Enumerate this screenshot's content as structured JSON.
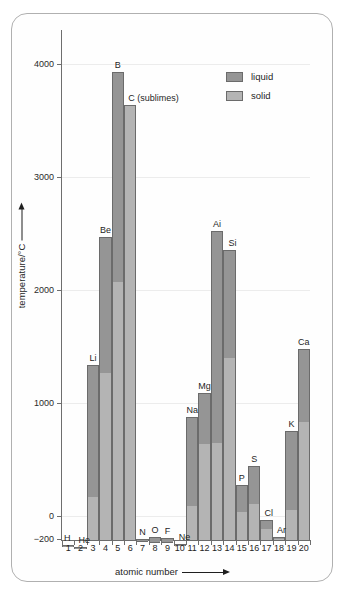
{
  "chart_data": {
    "type": "bar",
    "title": "",
    "xlabel": "atomic number",
    "ylabel": "temperature/°C",
    "ylim": [
      -275,
      4180
    ],
    "yticks": [
      4000,
      3000,
      2000,
      1000,
      0,
      -200
    ],
    "ytick_labels": [
      "4000",
      "3000",
      "2000",
      "1000",
      "0",
      "−200"
    ],
    "grid": true,
    "legend_position": "top-right",
    "baseline": -273,
    "categories": [
      1,
      2,
      3,
      4,
      5,
      6,
      7,
      8,
      9,
      10,
      11,
      12,
      13,
      14,
      15,
      16,
      17,
      18,
      19,
      20
    ],
    "xtick_labels": [
      "1",
      "2",
      "3",
      "4",
      "5",
      "6",
      "7",
      "8",
      "9",
      "10",
      "11",
      "12",
      "13",
      "14",
      "15",
      "16",
      "17",
      "18",
      "19",
      "20"
    ],
    "series": [
      {
        "name": "solid",
        "description": "solid range: from absolute zero baseline up to the melting point",
        "values": [
          -259,
          -272,
          180,
          1280,
          2080,
          3640,
          -210,
          -219,
          -220,
          -249,
          98,
          650,
          660,
          1410,
          44,
          119,
          -101,
          -189,
          63,
          839
        ]
      },
      {
        "name": "liquid",
        "description": "liquid range: from melting point up to the boiling point",
        "values": [
          -253,
          -269,
          1342,
          2470,
          3930,
          3640,
          -196,
          -183,
          -188,
          -246,
          883,
          1090,
          2519,
          2355,
          280,
          445,
          -34,
          -186,
          759,
          1484
        ]
      }
    ],
    "bar_labels": [
      "H",
      "He",
      "Li",
      "Be",
      "B",
      "C (sublimes)",
      "N",
      "O",
      "F",
      "Ne",
      "Na",
      "Mg",
      "Ai",
      "Si",
      "P",
      "S",
      "Cl",
      "Ar",
      "K",
      "Ca"
    ],
    "legend": [
      {
        "key": "liquid",
        "label": "liquid",
        "color": "#959595"
      },
      {
        "key": "solid",
        "label": "solid",
        "color": "#b4b4b4"
      }
    ]
  },
  "axes": {
    "y_title": "temperature/°C",
    "x_title": "atomic number"
  },
  "colors": {
    "liquid": "#959595",
    "solid": "#b4b4b4",
    "bar_outline": "#6b6b6b",
    "axis": "#6e6e6e",
    "grid": "#ececec",
    "frame": "#b0b0b0",
    "text": "#1f1f1f"
  }
}
